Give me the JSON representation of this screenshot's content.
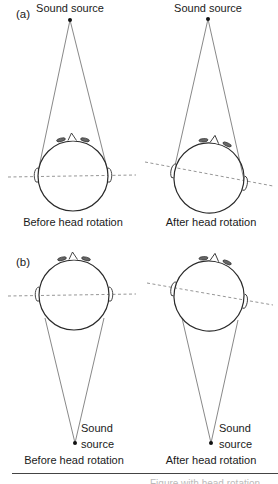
{
  "figure": {
    "panels": [
      {
        "id": "a",
        "label": "(a)",
        "source_position": "front",
        "diagrams": [
          {
            "caption": "Before head rotation",
            "source_label": "Sound source",
            "head_rotation_deg": 0
          },
          {
            "caption": "After head rotation",
            "source_label": "Sound source",
            "head_rotation_deg": 10
          }
        ]
      },
      {
        "id": "b",
        "label": "(b)",
        "source_position": "rear",
        "diagrams": [
          {
            "caption": "Before head rotation",
            "source_label_line1": "Sound",
            "source_label_line2": "source",
            "head_rotation_deg": 0
          },
          {
            "caption": "After head rotation",
            "source_label_line1": "Sound",
            "source_label_line2": "source",
            "head_rotation_deg": 10
          }
        ]
      }
    ],
    "colors": {
      "line": "#333333",
      "thin_line": "#555555",
      "dashed_axis": "#8a8a8a",
      "text": "#1a1a1a"
    },
    "footer_cutoff_text": "Figure with head rotation"
  }
}
